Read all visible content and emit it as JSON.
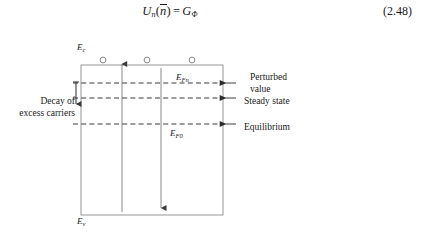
{
  "equation": {
    "lhs_symbol": "U",
    "lhs_subscript": "n",
    "argument_open": "(",
    "argument_symbol": "n",
    "argument_close": ")",
    "operator": "=",
    "rhs_symbol": "G",
    "rhs_subscript": "Φ",
    "full_text": "Uₙ(n̄) = GΦ",
    "number": "(2.48)"
  },
  "diagram": {
    "band_labels": {
      "conduction_band": {
        "symbol": "E",
        "subscript": "c"
      },
      "valence_band": {
        "symbol": "E",
        "subscript": "v"
      },
      "quasi_fermi_perturbed": {
        "symbol": "E",
        "subscript": "Fn"
      },
      "fermi_equilibrium": {
        "symbol": "E",
        "subscript": "F0"
      }
    },
    "annotations": {
      "decay_line1": "Decay of",
      "decay_line2": "excess carriers",
      "perturbed_line1": "Perturbed",
      "perturbed_line2": "value",
      "steady_state": "Steady state",
      "equilibrium": "Equilibrium"
    },
    "carriers": {
      "count": 3,
      "glyph": "electron-circle"
    },
    "colors": {
      "stroke": "#6b6b6b",
      "text": "#1a1a1a",
      "dashed": "#3a3a3a",
      "background": "#ffffff"
    }
  }
}
